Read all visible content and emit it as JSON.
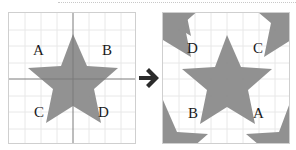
{
  "diagram": {
    "left_panel": {
      "labels": {
        "top_left": "A",
        "top_right": "B",
        "bottom_left": "C",
        "bottom_right": "D"
      }
    },
    "right_panel": {
      "labels": {
        "top_left": "D",
        "top_right": "C",
        "bottom_left": "B",
        "bottom_right": "A"
      }
    },
    "arrow_icon": "right-arrow",
    "colors": {
      "star": "#8c8c8c",
      "grid": "#e6e6e6",
      "axis": "#7a7a7a",
      "arrow": "#2b2b2b"
    }
  }
}
